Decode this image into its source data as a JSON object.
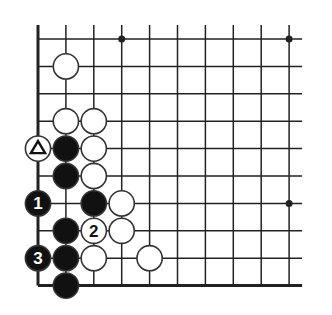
{
  "diagram": {
    "type": "go-board-fragment",
    "corner": "bottom-left",
    "columns": 10,
    "rows": 10,
    "grid": {
      "x0": 38,
      "dx": 27.9,
      "y0": 39,
      "dy": 27.4,
      "line_color": "#222222",
      "edge_line_width": 3,
      "line_width": 1.5
    },
    "edges": {
      "left": true,
      "bottom": true,
      "top": false,
      "right": false
    },
    "star_points": [
      {
        "col": 3,
        "row": 0
      },
      {
        "col": 9,
        "row": 0
      },
      {
        "col": 9,
        "row": 6
      }
    ],
    "stones": [
      {
        "color": "white",
        "col": 1,
        "row": 1,
        "label": "",
        "marker": ""
      },
      {
        "color": "white",
        "col": 1,
        "row": 3,
        "label": "",
        "marker": ""
      },
      {
        "color": "white",
        "col": 2,
        "row": 3,
        "label": "",
        "marker": ""
      },
      {
        "color": "white",
        "col": 0,
        "row": 4,
        "label": "",
        "marker": "triangle"
      },
      {
        "color": "black",
        "col": 1,
        "row": 4,
        "label": "",
        "marker": ""
      },
      {
        "color": "white",
        "col": 2,
        "row": 4,
        "label": "",
        "marker": ""
      },
      {
        "color": "black",
        "col": 1,
        "row": 5,
        "label": "",
        "marker": ""
      },
      {
        "color": "white",
        "col": 2,
        "row": 5,
        "label": "",
        "marker": ""
      },
      {
        "color": "black",
        "col": 0,
        "row": 6,
        "label": "1",
        "marker": ""
      },
      {
        "color": "black",
        "col": 2,
        "row": 6,
        "label": "",
        "marker": ""
      },
      {
        "color": "white",
        "col": 3,
        "row": 6,
        "label": "",
        "marker": ""
      },
      {
        "color": "black",
        "col": 1,
        "row": 7,
        "label": "",
        "marker": ""
      },
      {
        "color": "white",
        "col": 2,
        "row": 7,
        "label": "2",
        "marker": ""
      },
      {
        "color": "white",
        "col": 3,
        "row": 7,
        "label": "",
        "marker": ""
      },
      {
        "color": "black",
        "col": 0,
        "row": 8,
        "label": "3",
        "marker": ""
      },
      {
        "color": "black",
        "col": 1,
        "row": 8,
        "label": "",
        "marker": ""
      },
      {
        "color": "white",
        "col": 2,
        "row": 8,
        "label": "",
        "marker": ""
      },
      {
        "color": "white",
        "col": 4,
        "row": 8,
        "label": "",
        "marker": ""
      },
      {
        "color": "black",
        "col": 1,
        "row": 9,
        "label": "",
        "marker": ""
      }
    ],
    "colors": {
      "black_stone": "#111111",
      "white_stone": "#ffffff",
      "stone_outline": "#333333",
      "black_label": "#ffffff",
      "white_label": "#111111",
      "background": "#ffffff"
    }
  }
}
